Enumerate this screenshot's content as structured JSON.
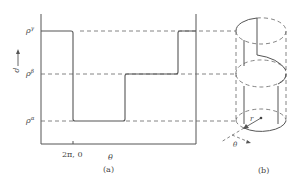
{
  "figure": {
    "panel_a": {
      "caption": "(a)",
      "y_axis_label": "ρ",
      "x_axis_label": "θ",
      "x_tick_label": "2π, 0",
      "levels": [
        {
          "name": "gamma",
          "label": "ρ",
          "sup": "γ"
        },
        {
          "name": "beta",
          "label": "ρ",
          "sup": "β"
        },
        {
          "name": "alpha",
          "label": "ρ",
          "sup": "α"
        }
      ]
    },
    "panel_b": {
      "caption": "(b)",
      "radius_label": "r",
      "angle_label": "θ"
    },
    "colors": {
      "line": "#555555",
      "dash": "#666666",
      "text": "#444444"
    }
  }
}
